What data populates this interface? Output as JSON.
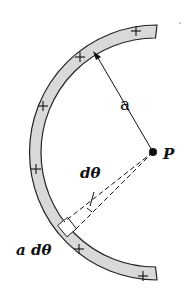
{
  "diagram": {
    "center_point": {
      "label": "P",
      "x": 153,
      "y": 152
    },
    "arc": {
      "inner_radius": 113,
      "outer_radius": 126,
      "start_angle_deg": -78,
      "end_angle_deg": 78,
      "fill": "#d9d9d9",
      "stroke": "#222222",
      "charge_symbol": "+",
      "charge_count": 7
    },
    "labels": {
      "radius": "a",
      "angle": "dθ",
      "arc_length": "a dθ",
      "point": "P"
    },
    "colors": {
      "background": "#ffffff",
      "arc_fill": "#d9d9d9",
      "line": "#111111"
    }
  }
}
